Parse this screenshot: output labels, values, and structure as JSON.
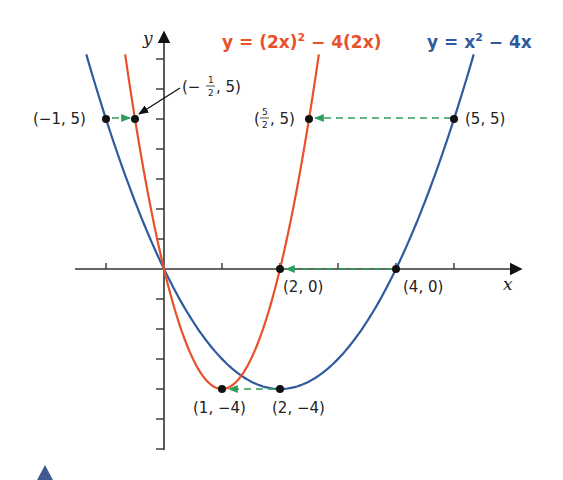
{
  "chart_data": {
    "type": "line",
    "title": "",
    "xlabel": "x",
    "ylabel": "y",
    "xlim": [
      -1.8,
      6.0
    ],
    "ylim": [
      -6.0,
      7.3
    ],
    "grid": false,
    "x_ticks": [
      -1,
      1,
      2,
      3,
      4,
      5
    ],
    "y_ticks": [
      -6,
      -5,
      -4,
      -3,
      -2,
      -1,
      1,
      2,
      3,
      4,
      5,
      6,
      7
    ],
    "series": [
      {
        "name": "y = x^2 - 4x",
        "label_parts": [
          "y = x",
          "2",
          " − 4x"
        ],
        "color": "#2f5a9e",
        "formula": "x^2-4x",
        "x_range": [
          -1.34,
          5.34
        ]
      },
      {
        "name": "y = (2x)^2 - 4(2x)",
        "label_parts": [
          "y = (2x)",
          "2",
          " − 4(2x)"
        ],
        "color": "#e8512a",
        "formula": "(2x)^2-4(2x)",
        "x_range": [
          -0.67,
          2.67
        ]
      }
    ],
    "points": [
      {
        "x": -1,
        "y": 5,
        "label": "(−1, 5)"
      },
      {
        "x": -0.5,
        "y": 5,
        "label": "(−½, 5)"
      },
      {
        "x": 2.5,
        "y": 5,
        "label": "(5/2, 5)"
      },
      {
        "x": 5,
        "y": 5,
        "label": "(5, 5)"
      },
      {
        "x": 2,
        "y": 0,
        "label": "(2, 0)"
      },
      {
        "x": 4,
        "y": 0,
        "label": "(4, 0)"
      },
      {
        "x": 1,
        "y": -4,
        "label": "(1, −4)"
      },
      {
        "x": 2,
        "y": -4,
        "label": "(2, −4)"
      }
    ],
    "annotations": [
      {
        "type": "green-dashed-arrow",
        "from": [
          -1,
          5
        ],
        "to": [
          -0.5,
          5
        ]
      },
      {
        "type": "green-dashed-arrow",
        "from": [
          5,
          5
        ],
        "to": [
          2.5,
          5
        ]
      },
      {
        "type": "green-dashed-arrow",
        "from": [
          4,
          0
        ],
        "to": [
          2,
          0
        ]
      },
      {
        "type": "green-dashed-arrow",
        "from": [
          2,
          -4
        ],
        "to": [
          1,
          -4
        ]
      },
      {
        "type": "black-pointer-arrow",
        "target": [
          -0.5,
          5
        ],
        "label": "(−½, 5)"
      }
    ]
  },
  "labels": {
    "pt_m1_5": "(−1, 5)",
    "pt_mhalf_5_open": "(−",
    "pt_mhalf_5_num": "1",
    "pt_mhalf_5_den": "2",
    "pt_mhalf_5_close": ", 5)",
    "pt_52_5_open": "(",
    "pt_52_5_num": "5",
    "pt_52_5_den": "2",
    "pt_52_5_close": ", 5)",
    "pt_5_5": "(5, 5)",
    "pt_2_0": "(2, 0)",
    "pt_4_0": "(4, 0)",
    "pt_1_m4": "(1, −4)",
    "pt_2_m4": "(2, −4)",
    "x_axis": "x",
    "y_axis": "y",
    "eq_red_a": "y = (2x)",
    "eq_red_sup": "2",
    "eq_red_b": " − 4(2x)",
    "eq_blue_a": "y = x",
    "eq_blue_sup": "2",
    "eq_blue_b": " − 4x"
  },
  "colors": {
    "red": "#e8512a",
    "blue": "#2f5a9e",
    "green": "#2e9e5a",
    "axis": "#333333",
    "marker": "#111111"
  }
}
